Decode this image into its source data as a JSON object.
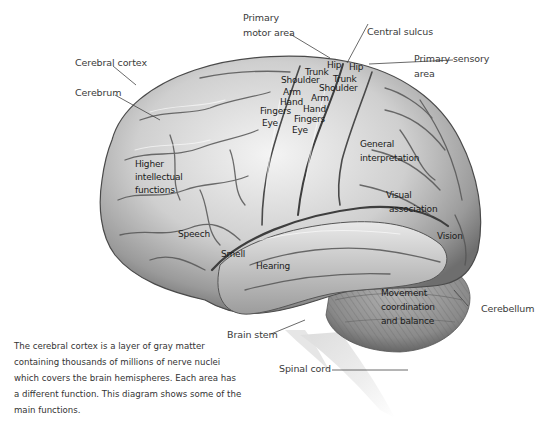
{
  "diagram": {
    "colors": {
      "brain_light": "#f2f2f2",
      "brain_mid": "#b9b9b9",
      "brain_dark": "#5e5e5e",
      "cerebellum": "#8c8c8c",
      "label_text": "#3a3a3a",
      "leader_line": "#444444"
    },
    "outer_labels": {
      "primary_motor_area_line1": "Primary",
      "primary_motor_area_line2": "motor area",
      "central_sulcus": "Central sulcus",
      "primary_sensory_area_line1": "Primary sensory",
      "primary_sensory_area_line2": "area",
      "cerebral_cortex": "Cerebral cortex",
      "cerebrum": "Cerebrum",
      "cerebellum": "Cerebellum",
      "brain_stem": "Brain stem",
      "spinal_cord": "Spinal cord"
    },
    "motor_strip": [
      "Hip",
      "Trunk",
      "Shoulder",
      "Arm",
      "Hand",
      "Fingers",
      "Eye"
    ],
    "sensory_strip": [
      "Hip",
      "Trunk",
      "Shoulder",
      "Arm",
      "Hand",
      "Fingers",
      "Eye"
    ],
    "function_labels": {
      "higher_intellectual_line1": "Higher",
      "higher_intellectual_line2": "intellectual",
      "higher_intellectual_line3": "functions",
      "speech": "Speech",
      "smell": "Smell",
      "hearing": "Hearing",
      "general_interpretation_line1": "General",
      "general_interpretation_line2": "interpretation",
      "visual_association_line1": "Visual",
      "visual_association_line2": "association",
      "vision": "Vision",
      "movement_line1": "Movement",
      "movement_line2": "coordination",
      "movement_line3": "and balance"
    },
    "caption": "The cerebral cortex is a layer of gray matter containing thousands of millions of nerve nuclei which covers the brain hemispheres. Each area has a different function. This diagram shows some of the main functions."
  }
}
